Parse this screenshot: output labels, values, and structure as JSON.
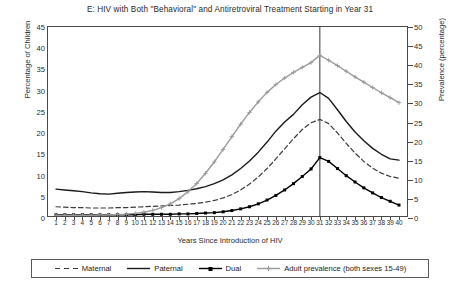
{
  "chart_data": {
    "type": "line",
    "title": "E: HIV with Both \"Behavioral\" and Antiretroviral Treatment Starting in Year 31",
    "xlabel": "Years Since Introduction of HIV",
    "ylabel": "Percentage of Children",
    "y2label": "Prevalence (percentage)",
    "xlim": [
      1,
      40
    ],
    "ylim": [
      0,
      45
    ],
    "y2lim": [
      0,
      50
    ],
    "grid": false,
    "legend_position": "bottom",
    "annotations": [
      {
        "type": "vline",
        "x": 31,
        "label": "Treatment starting in Year 31"
      }
    ],
    "x": [
      1,
      2,
      3,
      4,
      5,
      6,
      7,
      8,
      9,
      10,
      11,
      12,
      13,
      14,
      15,
      16,
      17,
      18,
      19,
      20,
      21,
      22,
      23,
      24,
      25,
      26,
      27,
      28,
      29,
      30,
      31,
      32,
      33,
      34,
      35,
      36,
      37,
      38,
      39,
      40
    ],
    "x_ticks": [
      "1",
      "2",
      "3",
      "4",
      "5",
      "6",
      "7",
      "8",
      "9",
      "10",
      "11",
      "12",
      "13",
      "14",
      "15",
      "16",
      "17",
      "18",
      "19",
      "20",
      "21",
      "22",
      "23",
      "24",
      "25",
      "26",
      "27",
      "28",
      "29",
      "30",
      "31",
      "32",
      "33",
      "34",
      "35",
      "36",
      "37",
      "38",
      "39",
      "40"
    ],
    "y_ticks": [
      "0",
      "5",
      "10",
      "15",
      "20",
      "25",
      "30",
      "35",
      "40",
      "45"
    ],
    "y2_ticks": [
      "0",
      "5",
      "10",
      "15",
      "20",
      "25",
      "30",
      "35",
      "40",
      "45",
      "50"
    ],
    "series": [
      {
        "name": "Maternal",
        "axis": "left",
        "style": "dashed",
        "color": "#3a3a3a",
        "marker": "none",
        "values": [
          2.2,
          2.1,
          2.0,
          2.0,
          1.9,
          1.9,
          1.9,
          2.0,
          2.0,
          2.1,
          2.2,
          2.3,
          2.4,
          2.5,
          2.6,
          2.8,
          3.0,
          3.3,
          3.7,
          4.3,
          5.1,
          6.2,
          7.6,
          9.3,
          11.3,
          13.6,
          16.0,
          18.4,
          20.6,
          22.2,
          23.0,
          22.0,
          19.8,
          17.3,
          15.0,
          13.0,
          11.4,
          10.2,
          9.4,
          9.0
        ]
      },
      {
        "name": "Paternal",
        "axis": "left",
        "style": "solid",
        "color": "#1a1a1a",
        "marker": "none",
        "values": [
          6.4,
          6.2,
          6.0,
          5.8,
          5.5,
          5.3,
          5.2,
          5.4,
          5.6,
          5.7,
          5.8,
          5.7,
          5.6,
          5.6,
          5.8,
          6.1,
          6.5,
          7.0,
          7.7,
          8.6,
          9.8,
          11.3,
          13.1,
          15.2,
          17.6,
          20.2,
          22.4,
          24.2,
          26.5,
          28.3,
          29.4,
          28.0,
          25.3,
          22.5,
          20.0,
          17.9,
          16.1,
          14.7,
          13.6,
          13.3
        ]
      },
      {
        "name": "Dual",
        "axis": "left",
        "style": "solid",
        "color": "#000000",
        "marker": "square",
        "values": [
          0.3,
          0.3,
          0.3,
          0.3,
          0.3,
          0.3,
          0.3,
          0.3,
          0.3,
          0.3,
          0.4,
          0.4,
          0.4,
          0.4,
          0.5,
          0.5,
          0.6,
          0.7,
          0.8,
          1.0,
          1.3,
          1.7,
          2.2,
          2.9,
          3.8,
          4.9,
          6.2,
          7.7,
          9.4,
          11.2,
          13.9,
          13.0,
          11.3,
          9.6,
          8.1,
          6.7,
          5.5,
          4.4,
          3.5,
          2.6
        ]
      },
      {
        "name": "Adult prevalence (both sexes 15-49)",
        "axis": "right",
        "style": "solid",
        "color": "#9a9a9a",
        "marker": "star",
        "values": [
          0.2,
          0.2,
          0.2,
          0.2,
          0.2,
          0.3,
          0.3,
          0.4,
          0.5,
          0.7,
          1.0,
          1.5,
          2.2,
          3.2,
          4.6,
          6.4,
          8.6,
          11.3,
          14.3,
          17.6,
          21.0,
          24.3,
          27.4,
          30.2,
          32.7,
          34.8,
          36.5,
          38.0,
          39.3,
          40.6,
          42.5,
          41.2,
          39.8,
          38.3,
          36.8,
          35.4,
          34.0,
          32.6,
          31.3,
          30.0
        ]
      }
    ]
  },
  "legend": {
    "items": [
      {
        "label": "Maternal",
        "swatch": "dashed-line-swatch"
      },
      {
        "label": "Paternal",
        "swatch": "solid-line-swatch"
      },
      {
        "label": "Dual",
        "swatch": "solid-marker-line-swatch"
      },
      {
        "label": "Adult prevalence (both sexes 15-49)",
        "swatch": "gray-marker-line-swatch"
      }
    ]
  }
}
